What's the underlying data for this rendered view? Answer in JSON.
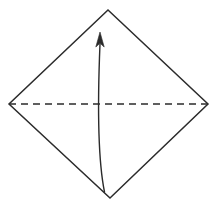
{
  "figure": {
    "canvas": {
      "width": 220,
      "height": 205,
      "background": "#ffffff"
    },
    "shapes": {
      "diamond": {
        "name": "square-rotated-45",
        "points": "108,10 208,104 110,198 9,104",
        "stroke": "#2b2b2b",
        "stroke_width": 1.5,
        "fill": "none"
      },
      "fold_line": {
        "name": "horizontal-fold-crease",
        "x1": 9,
        "y1": 104,
        "x2": 208,
        "y2": 104,
        "stroke": "#2b2b2b",
        "stroke_width": 1.5,
        "dash": "7 5"
      },
      "fold_arrow": {
        "name": "upward-fold-arrow",
        "path": "M 104.5,192 C 96,150 98.5,80 100,44",
        "stroke": "#2b2b2b",
        "stroke_width": 1.4,
        "fill": "none",
        "arrowhead": {
          "points": "100,32 104.2,47 100,43.2 95.8,47",
          "fill": "#2b2b2b"
        }
      }
    }
  }
}
